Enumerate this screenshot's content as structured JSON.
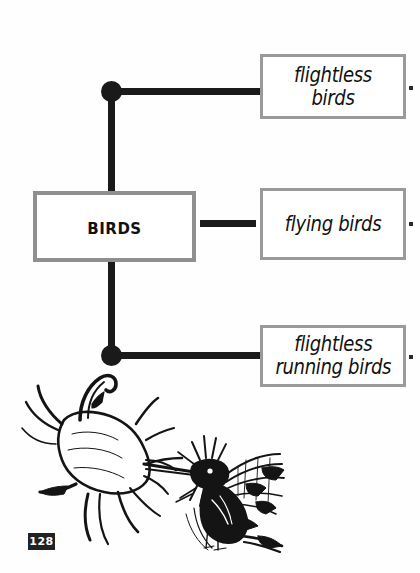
{
  "page": {
    "background_color": "#fefefe",
    "width": 420,
    "height": 573,
    "page_number": "128"
  },
  "diagram": {
    "type": "concept-map",
    "root": {
      "label": "Birds",
      "box": {
        "x": 33,
        "y": 191,
        "width": 163,
        "height": 71
      },
      "border_color": "#8f8f8f",
      "text_color": "#111111"
    },
    "branches": [
      {
        "id": "flightless-birds",
        "label": "flightless birds",
        "box": {
          "x": 260,
          "y": 54,
          "width": 146,
          "height": 65
        },
        "connector": "elbow-up",
        "has_junction_dot": true
      },
      {
        "id": "flying-birds",
        "label": "flying birds",
        "box": {
          "x": 260,
          "y": 188,
          "width": 146,
          "height": 72
        },
        "connector": "straight",
        "has_junction_dot": false
      },
      {
        "id": "flightless-running-birds",
        "label": "flightless\nrunning birds",
        "box": {
          "x": 260,
          "y": 325,
          "width": 146,
          "height": 62
        },
        "connector": "elbow-down",
        "has_junction_dot": true
      }
    ],
    "line_color": "#1a1a1a",
    "box_border_color": "#9a9a9a"
  },
  "edge_marks": [
    {
      "id": "edge-dot-top",
      "x": 409,
      "y": 86
    },
    {
      "id": "edge-dot-middle",
      "x": 409,
      "y": 222
    },
    {
      "id": "edge-dot-bottom",
      "x": 409,
      "y": 355
    }
  ],
  "illustration": {
    "name": "hummingbird-at-flower-sketch",
    "description": "Pen-and-ink sketch of a hummingbird feeding at a trumpet-shaped flower",
    "ink_color": "#141414"
  }
}
